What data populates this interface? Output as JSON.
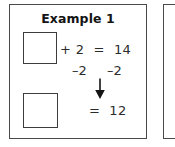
{
  "page": {
    "background_color": "#ffffff",
    "ink_color": "#2b2b2b",
    "border_color": "#4a4a4a"
  },
  "panels": [
    {
      "id": "example-1",
      "title": "Example 1",
      "visible": "full",
      "boxes": [
        {
          "name": "answer-box-top",
          "value": "",
          "position": "top"
        },
        {
          "name": "answer-box-bottom",
          "value": "",
          "position": "bottom"
        }
      ],
      "equation": {
        "row1": "+ 2  =  14",
        "row2_left": "–2",
        "row2_right": "–2",
        "row3": "=  12",
        "arrow": "down-arrow"
      }
    },
    {
      "id": "example-2",
      "title": "",
      "visible": "clipped"
    }
  ]
}
